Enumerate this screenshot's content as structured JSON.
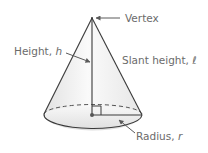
{
  "diagram": {
    "labels": {
      "vertex": "Vertex",
      "height": "Height, ",
      "height_var": "h",
      "slant": "Slant height, ",
      "slant_var": "ℓ",
      "radius": "Radius, ",
      "radius_var": "r"
    },
    "colors": {
      "stroke": "#3a3a3a",
      "fill_light": "#f4f4f4",
      "fill_dark": "#dcdcdc",
      "label": "#6b6b6b",
      "arrow": "#5a5a5a"
    }
  }
}
